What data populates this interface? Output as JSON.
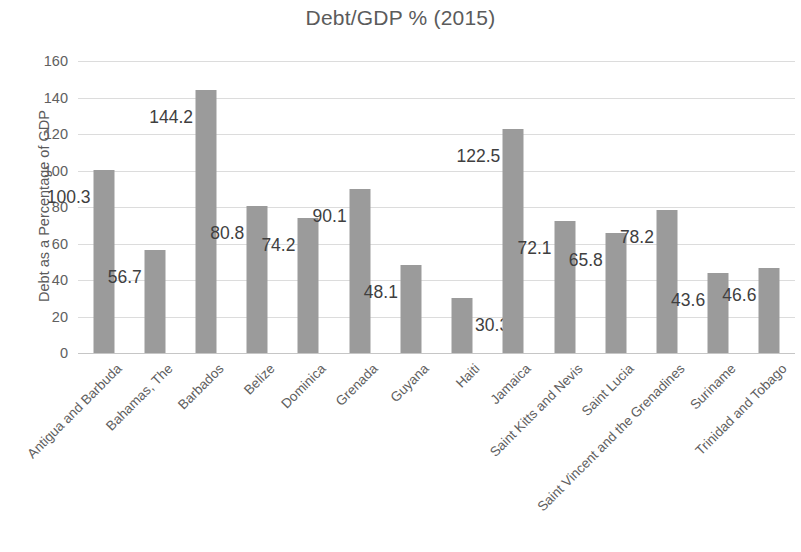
{
  "chart_data": {
    "type": "bar",
    "title": "Debt/GDP % (2015)",
    "xlabel": "",
    "ylabel": "Debt as a Percentage of GDP",
    "ylim": [
      0,
      160
    ],
    "y_ticks": [
      0,
      20,
      40,
      60,
      80,
      100,
      120,
      140,
      160
    ],
    "y_tick_labels": [
      "0",
      "20",
      "40",
      "60",
      "80",
      "100",
      "120",
      "140",
      "160"
    ],
    "grid": true,
    "legend": "none",
    "bar_color": "#9b9b9b",
    "gridline_color": "#dcdcdc",
    "title_color": "#5b5b5b",
    "label_color": "#3f3f3f",
    "categories": [
      "Antigua and Barbuda",
      "Bahamas, The",
      "Barbados",
      "Belize",
      "Dominica",
      "Grenada",
      "Guyana",
      "Haiti",
      "Jamaica",
      "Saint Kitts and Nevis",
      "Saint Lucia",
      "Saint Vincent and the Grenadines",
      "Suriname",
      "Trinidad and Tobago"
    ],
    "values": [
      100.3,
      56.7,
      144.2,
      80.8,
      74.2,
      90.1,
      48.1,
      30.3,
      122.5,
      72.1,
      65.8,
      78.2,
      43.6,
      46.6
    ],
    "data_labels": [
      "100.3",
      "56.7",
      "144.2",
      "80.8",
      "74.2",
      "90.1",
      "48.1",
      "30.3",
      "122.5",
      "72.1",
      "65.8",
      "78.2",
      "43.6",
      "46.6"
    ],
    "label_side": [
      "left",
      "left",
      "left",
      "left",
      "left",
      "left",
      "left",
      "right",
      "left",
      "left",
      "left",
      "left",
      "left",
      "left"
    ]
  }
}
